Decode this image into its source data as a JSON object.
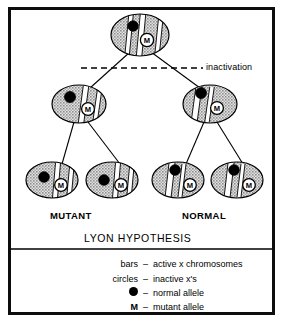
{
  "figure": {
    "title": "LYON HYPOTHESIS",
    "inactivation_label": "inactivation",
    "group_labels": {
      "left": "MUTANT",
      "right": "NORMAL"
    },
    "colors": {
      "ink": "#000000",
      "border": "#0d0d0d",
      "cell_fill": "#c9c9c9",
      "bar_fill": "#ffffff",
      "allele_dot": "#000000",
      "background": "#ffffff"
    },
    "mutant_marker": "M",
    "legend": [
      {
        "key": "bars",
        "dash": "–",
        "value": "active x chromosomes",
        "icon": "none"
      },
      {
        "key": "circles",
        "dash": "–",
        "value": "inactive x's",
        "icon": "none"
      },
      {
        "key": "",
        "dash": "–",
        "value": "normal allele",
        "icon": "filled-circle"
      },
      {
        "key": "M",
        "dash": "–",
        "value": "mutant allele",
        "icon": "letter-m"
      }
    ],
    "cells": [
      {
        "id": "precursor-cell",
        "row": "top",
        "cx": 140,
        "cy": 35,
        "rx": 29,
        "ry": 21,
        "bars": [
          {
            "x1": 131,
            "y1": 15,
            "x2": 127,
            "y2": 56,
            "w": 4.5
          },
          {
            "x1": 143,
            "y1": 14,
            "x2": 139,
            "y2": 57,
            "w": 5.5
          },
          {
            "x1": 161,
            "y1": 16,
            "x2": 157,
            "y2": 55,
            "w": 4.5
          }
        ],
        "allele_dot": {
          "cx": 133,
          "cy": 26,
          "r": 5.2
        },
        "m_circle": {
          "cx": 147,
          "cy": 40,
          "r": 6.6
        }
      },
      {
        "id": "mutant-parent-cell",
        "row": "middle",
        "cx": 79,
        "cy": 104,
        "rx": 27,
        "ry": 19,
        "bars": [
          {
            "x1": 86,
            "y1": 86,
            "x2": 81,
            "y2": 123,
            "w": 5.5
          },
          {
            "x1": 100,
            "y1": 87,
            "x2": 95,
            "y2": 122,
            "w": 4.5
          }
        ],
        "allele_dot": {
          "cx": 70,
          "cy": 97,
          "r": 5.5
        },
        "m_circle": {
          "cx": 88,
          "cy": 109,
          "r": 6.4
        }
      },
      {
        "id": "normal-parent-cell",
        "row": "middle",
        "cx": 210,
        "cy": 104,
        "rx": 27,
        "ry": 19,
        "bars": [
          {
            "x1": 199,
            "y1": 86,
            "x2": 194,
            "y2": 123,
            "w": 6.0
          },
          {
            "x1": 212,
            "y1": 87,
            "x2": 207,
            "y2": 122,
            "w": 4.5
          }
        ],
        "allele_dot": {
          "cx": 201,
          "cy": 93,
          "r": 5.5
        },
        "m_circle": {
          "cx": 217,
          "cy": 108,
          "r": 6.4
        }
      },
      {
        "id": "mutant-daughter-cell-1",
        "row": "bottom",
        "cx": 52,
        "cy": 180,
        "rx": 26,
        "ry": 18,
        "bars": [
          {
            "x1": 58,
            "y1": 163,
            "x2": 55,
            "y2": 198,
            "w": 5.0
          },
          {
            "x1": 72,
            "y1": 164,
            "x2": 69,
            "y2": 197,
            "w": 4.5
          }
        ],
        "allele_dot": {
          "cx": 44,
          "cy": 177,
          "r": 5.3
        },
        "m_circle": {
          "cx": 61,
          "cy": 185,
          "r": 6.3
        }
      },
      {
        "id": "mutant-daughter-cell-2",
        "row": "bottom",
        "cx": 112,
        "cy": 180,
        "rx": 26,
        "ry": 18,
        "bars": [
          {
            "x1": 118,
            "y1": 163,
            "x2": 115,
            "y2": 198,
            "w": 5.0
          },
          {
            "x1": 132,
            "y1": 164,
            "x2": 129,
            "y2": 197,
            "w": 4.5
          }
        ],
        "allele_dot": {
          "cx": 104,
          "cy": 180,
          "r": 5.3
        },
        "m_circle": {
          "cx": 121,
          "cy": 185,
          "r": 6.3
        }
      },
      {
        "id": "normal-daughter-cell-1",
        "row": "bottom",
        "cx": 178,
        "cy": 180,
        "rx": 26,
        "ry": 18,
        "bars": [
          {
            "x1": 172,
            "y1": 163,
            "x2": 168,
            "y2": 198,
            "w": 6.0
          },
          {
            "x1": 184,
            "y1": 164,
            "x2": 180,
            "y2": 197,
            "w": 4.0
          }
        ],
        "allele_dot": {
          "cx": 175,
          "cy": 170,
          "r": 5.3
        },
        "m_circle": {
          "cx": 190,
          "cy": 185,
          "r": 6.3
        }
      },
      {
        "id": "normal-daughter-cell-2",
        "row": "bottom",
        "cx": 237,
        "cy": 180,
        "rx": 26,
        "ry": 18,
        "bars": [
          {
            "x1": 231,
            "y1": 163,
            "x2": 227,
            "y2": 198,
            "w": 6.0
          },
          {
            "x1": 243,
            "y1": 164,
            "x2": 239,
            "y2": 197,
            "w": 4.0
          }
        ],
        "allele_dot": {
          "cx": 234,
          "cy": 170,
          "r": 5.3
        },
        "m_circle": {
          "cx": 249,
          "cy": 185,
          "r": 6.3
        }
      }
    ],
    "connectors": [
      {
        "id": "precursor-to-mutant-parent",
        "x1": 130,
        "y1": 52,
        "x2": 90,
        "y2": 88
      },
      {
        "id": "precursor-to-normal-parent",
        "x1": 151,
        "y1": 52,
        "x2": 200,
        "y2": 88
      },
      {
        "id": "mutant-parent-to-daughter-1",
        "x1": 74,
        "y1": 122,
        "x2": 62,
        "y2": 164
      },
      {
        "id": "mutant-parent-to-daughter-2",
        "x1": 88,
        "y1": 122,
        "x2": 120,
        "y2": 164
      },
      {
        "id": "normal-parent-to-daughter-1",
        "x1": 204,
        "y1": 122,
        "x2": 186,
        "y2": 164
      },
      {
        "id": "normal-parent-to-daughter-2",
        "x1": 217,
        "y1": 122,
        "x2": 243,
        "y2": 164
      }
    ],
    "inactivation_line": {
      "x1": 81,
      "y1": 68,
      "x2": 203,
      "y2": 68
    },
    "divider_line": {
      "x1": 11,
      "y1": 249,
      "x2": 272,
      "y2": 249
    }
  }
}
